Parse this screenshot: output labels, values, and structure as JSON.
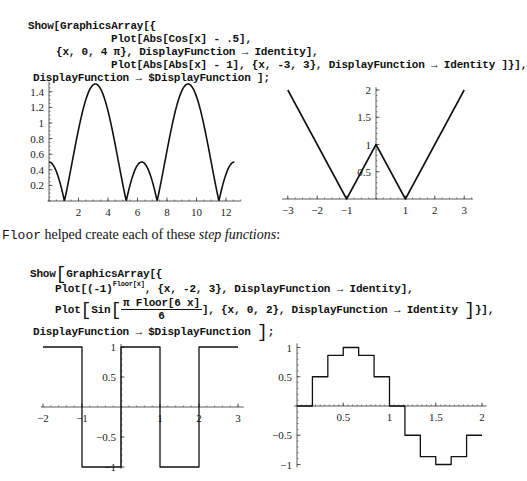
{
  "code_block_1": {
    "line1": "Show[GraphicsArray[{",
    "line2": "Plot[Abs[Cos[x] - .5],",
    "line3": "{x, 0, 4 π}, DisplayFunction → Identity],",
    "line4": "Plot[Abs[Abs[x] - 1], {x, -3, 3}, DisplayFunction → Identity ]}],",
    "line5": "DisplayFunction → $DisplayFunction ];"
  },
  "prose": {
    "function_name": "Floor",
    "text_middle": " helped create each of these ",
    "emphasis": "step functions",
    "text_end": ":"
  },
  "code_block_2": {
    "line1_show": "Show",
    "line1_rest": "GraphicsArray[{",
    "line2_plot": "Plot[(-1)",
    "line2_sup": "Floor[x]",
    "line2_rest": ", {x, -2, 3}, DisplayFunction → Identity],",
    "line3_plot": "Plot",
    "line3_sin": "Sin",
    "line3_num": "π Floor[6 x]",
    "line3_den": "6",
    "line3_rest": "], {x, 0, 2}, DisplayFunction → Identity ",
    "line3_close": "}],",
    "line4": "DisplayFunction → $DisplayFunction ",
    "line4_end": ";"
  },
  "chart_data": [
    {
      "type": "line",
      "title": "Abs[Cos[x] - .5]",
      "function": "Abs[Cos[x] - 0.5]",
      "x_range": [
        0,
        12.566
      ],
      "xlabel": "",
      "ylabel": "",
      "x_ticks": [
        2,
        4,
        6,
        8,
        10,
        12
      ],
      "y_ticks": [
        0.2,
        0.4,
        0.6,
        0.8,
        1,
        1.2,
        1.4
      ],
      "x_tick_labels": [
        "2",
        "4",
        "6",
        "8",
        "10",
        "12"
      ],
      "y_tick_labels": [
        "0.2",
        "0.4",
        "0.6",
        "0.8",
        "1",
        "1.2",
        "1.4"
      ],
      "ylim": [
        0,
        1.5
      ],
      "x": [
        0,
        1.047,
        3.1416,
        5.236,
        6.283,
        7.33,
        9.425,
        11.519,
        12.566
      ],
      "y": [
        0.5,
        0,
        1.5,
        0,
        0.5,
        0,
        1.5,
        0,
        0.5
      ],
      "grid": false
    },
    {
      "type": "line",
      "title": "Abs[Abs[x] - 1]",
      "function": "Abs[Abs[x] - 1]",
      "x_range": [
        -3,
        3
      ],
      "x_ticks": [
        -3,
        -2,
        -1,
        1,
        2,
        3
      ],
      "y_ticks": [
        0.5,
        1,
        1.5,
        2
      ],
      "x_tick_labels": [
        "−3",
        "−2",
        "−1",
        "1",
        "2",
        "3"
      ],
      "y_tick_labels": [
        "0.5",
        "1",
        "1.5",
        "2"
      ],
      "ylim": [
        0,
        2
      ],
      "x": [
        -3,
        -1,
        0,
        1,
        3
      ],
      "y": [
        2,
        0,
        1,
        0,
        2
      ],
      "grid": false
    },
    {
      "type": "line",
      "title": "(-1)^Floor[x]",
      "function": "(-1)^Floor[x]",
      "x_range": [
        -2,
        3
      ],
      "x_ticks": [
        -2,
        -1,
        1,
        2,
        3
      ],
      "y_ticks": [
        -1,
        -0.5,
        0.5,
        1
      ],
      "x_tick_labels": [
        "−2",
        "−1",
        "1",
        "2",
        "3"
      ],
      "y_tick_labels": [
        "−1",
        "−0.5",
        "0.5",
        "1"
      ],
      "ylim": [
        -1,
        1
      ],
      "x": [
        -2,
        -1,
        -1,
        0,
        0,
        1,
        1,
        2,
        2,
        3
      ],
      "y": [
        1,
        1,
        -1,
        -1,
        1,
        1,
        -1,
        -1,
        1,
        1
      ],
      "grid": false
    },
    {
      "type": "line",
      "title": "Sin[π Floor[6 x]/6]",
      "function": "Sin[Pi Floor[6 x]/6]",
      "x_range": [
        0,
        2
      ],
      "x_ticks": [
        0.5,
        1,
        1.5,
        2
      ],
      "y_ticks": [
        -1,
        -0.5,
        0.5,
        1
      ],
      "x_tick_labels": [
        "0.5",
        "1",
        "1.5",
        "2"
      ],
      "y_tick_labels": [
        "−1",
        "−0.5",
        "0.5",
        "1"
      ],
      "ylim": [
        -1,
        1
      ],
      "steps": [
        0,
        0.5,
        0.866,
        1,
        0.866,
        0.5,
        0,
        -0.5,
        -0.866,
        -1,
        -0.866,
        -0.5
      ],
      "step_width": 0.16667,
      "grid": false
    }
  ]
}
